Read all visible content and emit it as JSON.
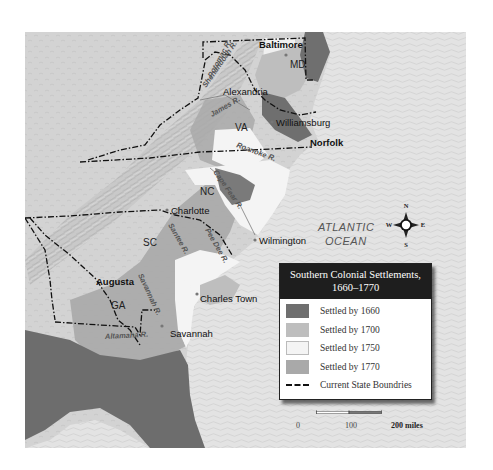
{
  "map": {
    "title": "Southern Colonial Settlements, 1660–1770",
    "title_line1": "Southern Colonial Settlements,",
    "title_line2": "1660–1770",
    "ocean_label_line1": "ATLANTIC",
    "ocean_label_line2": "OCEAN",
    "states": [
      {
        "abbr": "MD"
      },
      {
        "abbr": "VA"
      },
      {
        "abbr": "NC"
      },
      {
        "abbr": "SC"
      },
      {
        "abbr": "GA"
      }
    ],
    "cities": [
      "Baltimore",
      "Alexandria",
      "Williamsburg",
      "Norfolk",
      "Charlotte",
      "Wilmington",
      "Charles Town",
      "Augusta",
      "Savannah"
    ],
    "rivers": [
      "Potomac R.",
      "Shenandoah R.",
      "James R.",
      "Roanoke R.",
      "Cape Fear R.",
      "Santee R.",
      "Pee Dee R.",
      "Savannah R.",
      "Altamaha R."
    ],
    "compass": {
      "n": "N",
      "s": "S",
      "e": "E",
      "w": "W"
    }
  },
  "legend": {
    "items": [
      {
        "label": "Settled by 1660",
        "color": "#6f6f6f"
      },
      {
        "label": "Settled by 1700",
        "color": "#bebebe"
      },
      {
        "label": "Settled by 1750",
        "color": "#f4f4f4"
      },
      {
        "label": "Settled by 1770",
        "color": "#a9a9a9"
      }
    ],
    "boundary_label": "Current State Boundries"
  },
  "scale": {
    "labels": [
      "0",
      "100",
      "200 miles"
    ]
  },
  "colors": {
    "ocean": "#e2e2e2",
    "land_interior": "#cfcfcf",
    "mountains": "#b8b8b8",
    "settled_1660": "#6f6f6f",
    "settled_1700": "#bebebe",
    "settled_1750": "#f4f4f4",
    "settled_1770": "#a9a9a9",
    "florida": "#6a6a6a"
  }
}
